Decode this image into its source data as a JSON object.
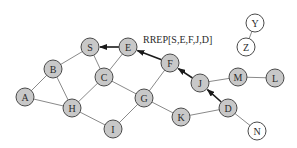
{
  "diagram": {
    "annotation": "RREP[S,E,F,J,D]",
    "colors": {
      "shaded_node": "#c8c8c8",
      "empty_node": "#ffffff",
      "edge": "#8a8a8a",
      "route_arrow": "#1a1a1a"
    },
    "nodes": [
      {
        "id": "S",
        "label": "S",
        "x": 90,
        "y": 47,
        "shaded": true
      },
      {
        "id": "E",
        "label": "E",
        "x": 128,
        "y": 47,
        "shaded": true
      },
      {
        "id": "B",
        "label": "B",
        "x": 53,
        "y": 69,
        "shaded": true
      },
      {
        "id": "C",
        "label": "C",
        "x": 104,
        "y": 77,
        "shaded": true
      },
      {
        "id": "A",
        "label": "A",
        "x": 25,
        "y": 97,
        "shaded": true
      },
      {
        "id": "H",
        "label": "H",
        "x": 72,
        "y": 108,
        "shaded": true
      },
      {
        "id": "G",
        "label": "G",
        "x": 144,
        "y": 98,
        "shaded": true
      },
      {
        "id": "I",
        "label": "I",
        "x": 113,
        "y": 129,
        "shaded": true
      },
      {
        "id": "F",
        "label": "F",
        "x": 170,
        "y": 63,
        "shaded": true
      },
      {
        "id": "J",
        "label": "J",
        "x": 200,
        "y": 83,
        "shaded": true
      },
      {
        "id": "M",
        "label": "M",
        "x": 238,
        "y": 77,
        "shaded": true
      },
      {
        "id": "L",
        "label": "L",
        "x": 275,
        "y": 78,
        "shaded": true
      },
      {
        "id": "K",
        "label": "K",
        "x": 181,
        "y": 117,
        "shaded": true
      },
      {
        "id": "D",
        "label": "D",
        "x": 228,
        "y": 108,
        "shaded": true
      },
      {
        "id": "N",
        "label": "N",
        "x": 257,
        "y": 131,
        "shaded": false
      },
      {
        "id": "Y",
        "label": "Y",
        "x": 255,
        "y": 23,
        "shaded": false
      },
      {
        "id": "Z",
        "label": "Z",
        "x": 246,
        "y": 47,
        "shaded": false
      }
    ],
    "edges": [
      [
        "S",
        "B"
      ],
      [
        "S",
        "C"
      ],
      [
        "E",
        "C"
      ],
      [
        "B",
        "A"
      ],
      [
        "B",
        "H"
      ],
      [
        "A",
        "H"
      ],
      [
        "C",
        "H"
      ],
      [
        "C",
        "G"
      ],
      [
        "H",
        "I"
      ],
      [
        "I",
        "G"
      ],
      [
        "G",
        "F"
      ],
      [
        "G",
        "K"
      ],
      [
        "K",
        "D"
      ],
      [
        "J",
        "M"
      ],
      [
        "M",
        "L"
      ],
      [
        "D",
        "N"
      ],
      [
        "Y",
        "Z"
      ]
    ],
    "route_arrows": [
      {
        "from": "E",
        "to": "S"
      },
      {
        "from": "F",
        "to": "E"
      },
      {
        "from": "J",
        "to": "F"
      },
      {
        "from": "D",
        "to": "J"
      }
    ]
  }
}
